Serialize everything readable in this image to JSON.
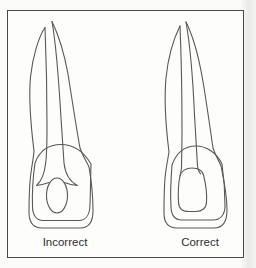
{
  "figure": {
    "left_label": "Incorrect",
    "right_label": "Correct"
  },
  "colors": {
    "line": "#585858",
    "frame_border": "#4a4a4a",
    "background": "#fdfdfc",
    "label_text": "#2f2f2f"
  }
}
